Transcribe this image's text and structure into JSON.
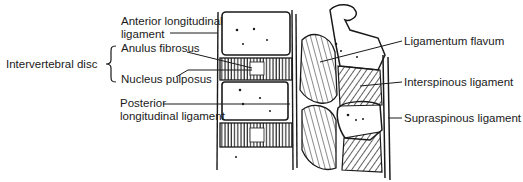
{
  "diagram": {
    "labels": {
      "anterior_longitudinal_1": "Anterior longitudinal",
      "anterior_longitudinal_2": "ligament",
      "intervertebral_disc": "Intervertebral disc",
      "anulus_fibrosus": "Anulus fibrosus",
      "nucleus_pulposus": "Nucleus pulposus",
      "posterior_longitudinal_1": "Posterior",
      "posterior_longitudinal_2": "longitudinal ligament",
      "ligamentum_flavum": "Ligamentum flavum",
      "interspinous_ligament": "Interspinous ligament",
      "supraspinous_ligament": "Supraspinous ligament"
    },
    "colors": {
      "ink": "#1a1a1a",
      "background": "#ffffff"
    }
  }
}
